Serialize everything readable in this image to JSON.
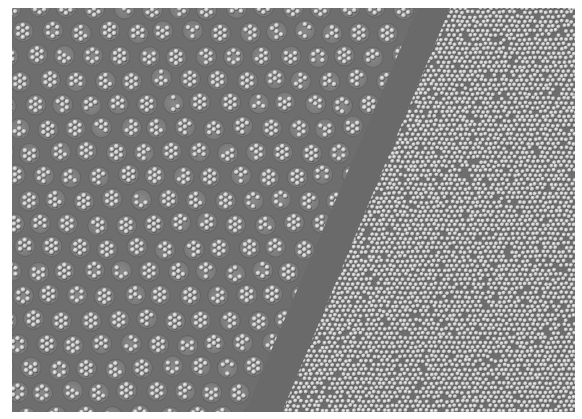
{
  "image": {
    "subject": "Micrograph of particle arrays: clustered hexagonal groups on left, dense monolayer of spheres on right, separated by a smooth diagonal band",
    "regions": [
      {
        "name": "clustered-array",
        "pattern": "small hexagonal clusters of beads in a lattice"
      },
      {
        "name": "diagonal-band",
        "pattern": "smooth empty gray strip"
      },
      {
        "name": "dense-monolayer",
        "pattern": "densely packed individual spheres"
      }
    ],
    "colors": {
      "background": "#6e6e6e",
      "band": "#6a6a6a",
      "highlight": "#e8e8e8",
      "shadow": "#3a3a3a",
      "page": "#ffffff"
    }
  }
}
